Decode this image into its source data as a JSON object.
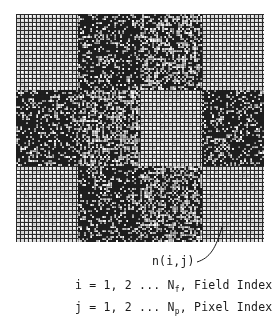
{
  "figure": {
    "grid": {
      "columns": 4,
      "rows": 3,
      "cell_pitch_px": 4,
      "blocks": [
        [
          "light",
          "dark",
          "medium",
          "light"
        ],
        [
          "dark",
          "medium",
          "light",
          "dark"
        ],
        [
          "light",
          "dark",
          "medium",
          "light"
        ]
      ],
      "colors": {
        "grid_line": "#2a2a2a",
        "light_cell": "#d8d8d8",
        "dark_base": "#1e1e1e",
        "speckle": "#e6e6e6"
      }
    },
    "pixel_label": "n(i,j)",
    "index_lines": [
      {
        "prefix": "i = 1, 2 ... N",
        "subscript": "f",
        "suffix": ", Field Index"
      },
      {
        "prefix": "j = 1, 2 ... N",
        "subscript": "p",
        "suffix": ", Pixel Index"
      }
    ]
  }
}
